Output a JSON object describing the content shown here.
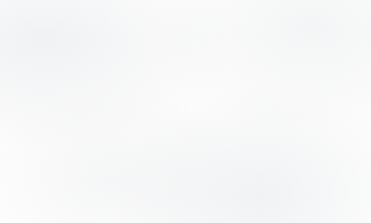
{
  "chart_data": {
    "type": "pie",
    "title": "",
    "subtitle": "",
    "xlabel": "",
    "ylabel": "",
    "legend_position": "callout-labels",
    "grid": false,
    "units": "percent",
    "categories": [
      "White",
      "Other",
      "Other Asian",
      "Chinese",
      "Asian/British Asian",
      "Black/Black British"
    ],
    "values": [
      73.5,
      15.8,
      2.2,
      2.0,
      3.9,
      2.6
    ],
    "colors": [
      "#e7b8c3",
      "#c6c6c6",
      "#dd8e92",
      "#8a8a8a",
      "#c0565f",
      "#5e5e5e"
    ],
    "slices": [
      {
        "label": "Other",
        "value": 15.8,
        "start_angle": 0.0,
        "end_angle": 57.0,
        "color": "#c6c6c6"
      },
      {
        "label": "Other Asian",
        "value": 2.2,
        "start_angle": 57.0,
        "end_angle": 65.0,
        "color": "#dd8e92"
      },
      {
        "label": "Chinese",
        "value": 2.0,
        "start_angle": 65.0,
        "end_angle": 72.2,
        "color": "#8a8a8a"
      },
      {
        "label": "Asian/British Asian",
        "value": 3.9,
        "start_angle": 72.2,
        "end_angle": 86.2,
        "color": "#c0565f"
      },
      {
        "label": "Black/Black British",
        "value": 2.6,
        "start_angle": 86.2,
        "end_angle": 95.5,
        "color": "#5e5e5e"
      },
      {
        "label": "White",
        "value": 73.5,
        "start_angle": 95.5,
        "end_angle": 360.0,
        "color": "#e7b8c3"
      }
    ]
  },
  "labels": {
    "white": "White",
    "other": "Other",
    "other_asian": "Other Asian",
    "chinese": "Chinese",
    "asian_british_asian": "Asian/British Asian",
    "black_black_british": "Black/Black British"
  },
  "style": {
    "background": "#fdfdfd",
    "outline": "#6b6b6b",
    "leader": "#3a3a3a",
    "text": "#1b1b1b"
  },
  "geometry": {
    "center_x": 162,
    "center_y": 121,
    "radius": 91
  }
}
